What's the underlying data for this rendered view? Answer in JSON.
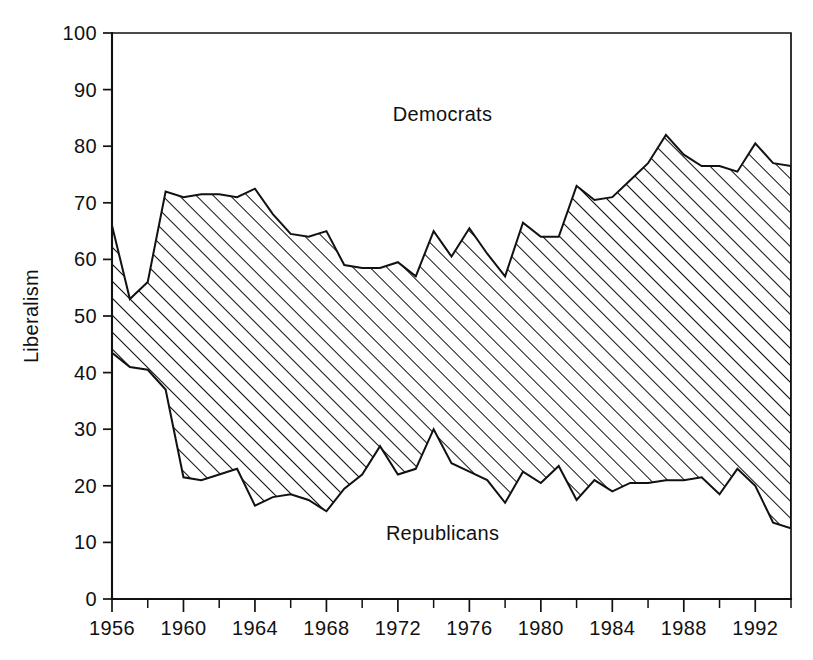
{
  "chart_data": {
    "type": "area",
    "title": "",
    "subtitle": "",
    "xlabel": "",
    "ylabel": "Liberalism",
    "xlim": [
      1956,
      1994
    ],
    "ylim": [
      0,
      100
    ],
    "grid": false,
    "legend_position": "inline-annotations",
    "annotations": [
      {
        "text": "Democrats",
        "x": 1974.5,
        "y": 84.5
      },
      {
        "text": "Republicans",
        "x": 1974.5,
        "y": 10.5
      }
    ],
    "y_ticks": [
      0,
      10,
      20,
      30,
      40,
      50,
      60,
      70,
      80,
      90,
      100
    ],
    "y_ticklabels": [
      "0",
      "10",
      "20",
      "30",
      "40",
      "50",
      "60",
      "70",
      "80",
      "90",
      "100"
    ],
    "x_ticks": [
      1956,
      1958,
      1960,
      1962,
      1964,
      1966,
      1968,
      1970,
      1972,
      1974,
      1976,
      1978,
      1980,
      1982,
      1984,
      1986,
      1988,
      1990,
      1992,
      1994
    ],
    "x_ticklabels_shown": [
      "1956",
      "1960",
      "1964",
      "1968",
      "1972",
      "1976",
      "1980",
      "1984",
      "1988",
      "1992"
    ],
    "x_ticklabel_values": [
      1956,
      1960,
      1964,
      1968,
      1972,
      1976,
      1980,
      1984,
      1988,
      1992
    ],
    "x": [
      1956,
      1957,
      1958,
      1959,
      1960,
      1961,
      1962,
      1963,
      1964,
      1965,
      1966,
      1967,
      1968,
      1969,
      1970,
      1971,
      1972,
      1973,
      1974,
      1975,
      1976,
      1977,
      1978,
      1979,
      1980,
      1981,
      1982,
      1983,
      1984,
      1985,
      1986,
      1987,
      1988,
      1989,
      1990,
      1991,
      1992,
      1993,
      1994
    ],
    "series": [
      {
        "name": "Democrats",
        "fill": "hatch-diagonal",
        "values": [
          66,
          53,
          56,
          72,
          71,
          71.5,
          71.5,
          71,
          72.5,
          68,
          64.5,
          64,
          65,
          59,
          58.5,
          58.5,
          59.5,
          57,
          65,
          60.5,
          65.5,
          61,
          57,
          66.5,
          64,
          64,
          73,
          70.5,
          71,
          74,
          77,
          82,
          78.5,
          76.5,
          76.5,
          75.5,
          80.5,
          77,
          76.5
        ]
      },
      {
        "name": "Republicans",
        "fill": "hatch-diagonal",
        "values": [
          43.5,
          41,
          40.5,
          37,
          21.5,
          21,
          22,
          23,
          16.5,
          18,
          18.5,
          17.5,
          15.5,
          19.5,
          22,
          27,
          22,
          23,
          30,
          24,
          22.5,
          21,
          17,
          22.5,
          20.5,
          23.5,
          17.5,
          21,
          19,
          20.5,
          20.5,
          21,
          21,
          21.5,
          18.5,
          23,
          20,
          13.5,
          12.5
        ]
      }
    ]
  },
  "axes": {
    "y_axis_label": "Liberalism"
  }
}
